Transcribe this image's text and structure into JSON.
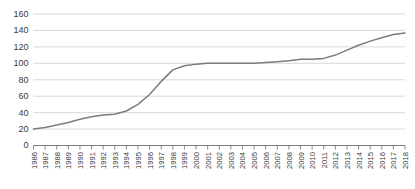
{
  "chart_data": {
    "type": "line",
    "title": "",
    "subtitle": "",
    "xlabel": "",
    "ylabel": "",
    "grid": true,
    "legend": false,
    "legend_position": "none",
    "ylim": [
      0,
      160
    ],
    "ytick_labels": [
      "0",
      "20",
      "40",
      "60",
      "80",
      "100",
      "120",
      "140",
      "160"
    ],
    "ytick_values": [
      0,
      20,
      40,
      60,
      80,
      100,
      120,
      140,
      160
    ],
    "categories": [
      "1986",
      "1987",
      "1988",
      "1989",
      "1990",
      "1991",
      "1992",
      "1993",
      "1994",
      "1995",
      "1996",
      "1997",
      "1998",
      "1999",
      "2000",
      "2001",
      "2002",
      "2003",
      "2004",
      "2005",
      "2006",
      "2007",
      "2008",
      "2009",
      "2010",
      "2011",
      "2012",
      "2013",
      "2014",
      "2015",
      "2016",
      "2017",
      "2018"
    ],
    "series": [
      {
        "name": "series-1",
        "color": "#7c7c7c",
        "values": [
          20,
          22,
          25,
          28,
          32,
          35,
          37,
          38,
          42,
          50,
          62,
          78,
          92,
          97,
          99,
          100,
          100,
          100,
          100,
          100,
          101,
          102,
          103,
          105,
          105,
          106,
          110,
          116,
          122,
          127,
          131,
          135,
          137
        ]
      }
    ]
  }
}
